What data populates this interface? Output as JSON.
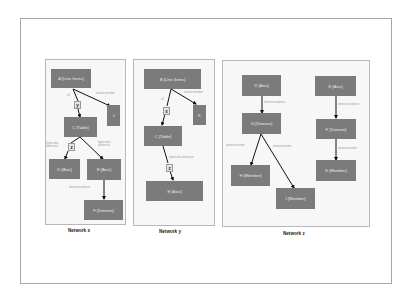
{
  "diagram": {
    "networks": [
      {
        "id": "x",
        "title": "Network x",
        "nodes": [
          {
            "id": "A",
            "label": "A [Line Items]"
          },
          {
            "id": "J",
            "label": "J"
          },
          {
            "id": "C",
            "label": "C [Table]"
          },
          {
            "id": "D",
            "label": "D [Axis]"
          },
          {
            "id": "E",
            "label": "E [Axis]"
          },
          {
            "id": "F",
            "label": "F [Domain]"
          }
        ],
        "intermediates": [
          {
            "id": "y",
            "label": "y"
          },
          {
            "id": "z",
            "label": "z"
          }
        ],
        "edges": [
          {
            "from": "A",
            "to": "C",
            "via": "y",
            "label": "all"
          },
          {
            "from": "A",
            "to": "J",
            "label": "domain-member"
          },
          {
            "from": "C",
            "to": "D",
            "via": "z",
            "label": "hypercube-dimension"
          },
          {
            "from": "C",
            "to": "E",
            "label": "hypercube-dimension"
          },
          {
            "from": "E",
            "to": "F",
            "label": "dimension-domain"
          }
        ]
      },
      {
        "id": "y",
        "title": "Network y",
        "nodes": [
          {
            "id": "B",
            "label": "B [Line Items]"
          },
          {
            "id": "K",
            "label": "K"
          },
          {
            "id": "C",
            "label": "C [Table]"
          },
          {
            "id": "E",
            "label": "E [Axis]"
          }
        ],
        "intermediates": [
          {
            "id": "x",
            "label": "x"
          },
          {
            "id": "z",
            "label": "z"
          }
        ],
        "edges": [
          {
            "from": "B",
            "to": "C",
            "via": "x",
            "label": "all"
          },
          {
            "from": "B",
            "to": "K",
            "label": "domain-member"
          },
          {
            "from": "C",
            "to": "E",
            "via": "z",
            "label": "hypercube-dimension"
          }
        ]
      },
      {
        "id": "z",
        "title": "Network z",
        "nodes": [
          {
            "id": "D",
            "label": "D [Axis]"
          },
          {
            "id": "G",
            "label": "G [Domain]"
          },
          {
            "id": "H",
            "label": "H [Member]"
          },
          {
            "id": "I",
            "label": "I [Member]"
          },
          {
            "id": "E",
            "label": "E [Axis]"
          },
          {
            "id": "F",
            "label": "F [Domain]"
          },
          {
            "id": "K",
            "label": "K [Member]"
          }
        ],
        "edges": [
          {
            "from": "D",
            "to": "G",
            "label": "dimension-domain"
          },
          {
            "from": "G",
            "to": "H",
            "label": "domain-member"
          },
          {
            "from": "G",
            "to": "I",
            "label": "domain-member"
          },
          {
            "from": "E",
            "to": "F",
            "label": "dimension-domain"
          },
          {
            "from": "F",
            "to": "K",
            "label": "domain-member"
          }
        ]
      }
    ]
  },
  "colors": {
    "node_fill": "#7b7b7b",
    "node_text": "#e8e8e8",
    "edge": "#111111",
    "panel_border": "#b8b8b8",
    "frame_border": "#a8a8a8"
  }
}
